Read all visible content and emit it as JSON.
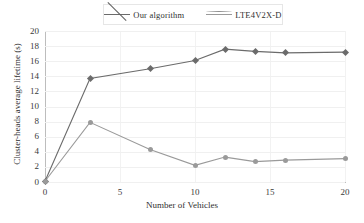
{
  "figure": {
    "background": "#ffffff"
  },
  "legend": {
    "position": "top-center",
    "entries": [
      {
        "label": "Our algorithm",
        "marker": "diamond-marker-icon",
        "color": "#6b6b6b"
      },
      {
        "label": "LTE4V2X-D",
        "marker": "circle-marker-icon",
        "color": "#9a9a9a"
      }
    ]
  },
  "axes": {
    "x": {
      "label": "Number of Vehicles",
      "ticks": [
        "0",
        "5",
        "10",
        "15",
        "20"
      ],
      "tick_values": [
        0,
        5,
        10,
        15,
        20
      ],
      "min": 0,
      "max": 20
    },
    "y": {
      "label": "Cluster-heads average lifetime (s)",
      "ticks": [
        "0",
        "2",
        "4",
        "6",
        "8",
        "10",
        "12",
        "14",
        "16",
        "18",
        "20"
      ],
      "tick_values": [
        0,
        2,
        4,
        6,
        8,
        10,
        12,
        14,
        16,
        18,
        20
      ],
      "min": 0,
      "max": 20
    }
  },
  "chart_data": {
    "type": "line",
    "title": "",
    "xlabel": "Number of Vehicles",
    "ylabel": "Cluster-heads average lifetime (s)",
    "xlim": [
      0,
      20
    ],
    "ylim": [
      0,
      20
    ],
    "grid": true,
    "legend_position": "top-center",
    "x": [
      0,
      3,
      7,
      10,
      12,
      14,
      16,
      20
    ],
    "series": [
      {
        "name": "Our algorithm",
        "marker": "diamond",
        "color": "#6b6b6b",
        "values": [
          0.1,
          13.7,
          15.0,
          16.1,
          17.6,
          17.3,
          17.1,
          17.2
        ]
      },
      {
        "name": "LTE4V2X-D",
        "marker": "circle",
        "color": "#9a9a9a",
        "values": [
          0.1,
          7.9,
          4.3,
          2.2,
          3.3,
          2.7,
          2.9,
          3.1
        ]
      }
    ]
  }
}
